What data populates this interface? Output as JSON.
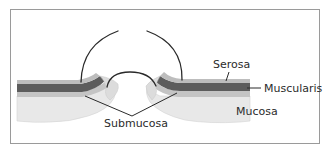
{
  "figure": {
    "type": "anatomical-diagram",
    "labels": {
      "serosa": "Serosa",
      "muscularis": "Muscularis",
      "mucosa": "Mucosa",
      "submucosa": "Submucosa"
    },
    "colors": {
      "line": "#2a2a2a",
      "frame": "#9a9a9a",
      "serosa": "#c8c8c8",
      "muscularis": "#5a5a5a",
      "submucosa": "#b9b9b9",
      "mucosa": "#e6e6e6"
    }
  }
}
